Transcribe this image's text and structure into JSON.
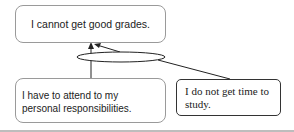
{
  "diagram": {
    "claim": "I cannot get good grades.",
    "reasons": [
      {
        "text": "I have to attend to my personal responsibilities."
      },
      {
        "text": "I do not get time to study."
      }
    ],
    "connector": "ellipse-joint"
  }
}
